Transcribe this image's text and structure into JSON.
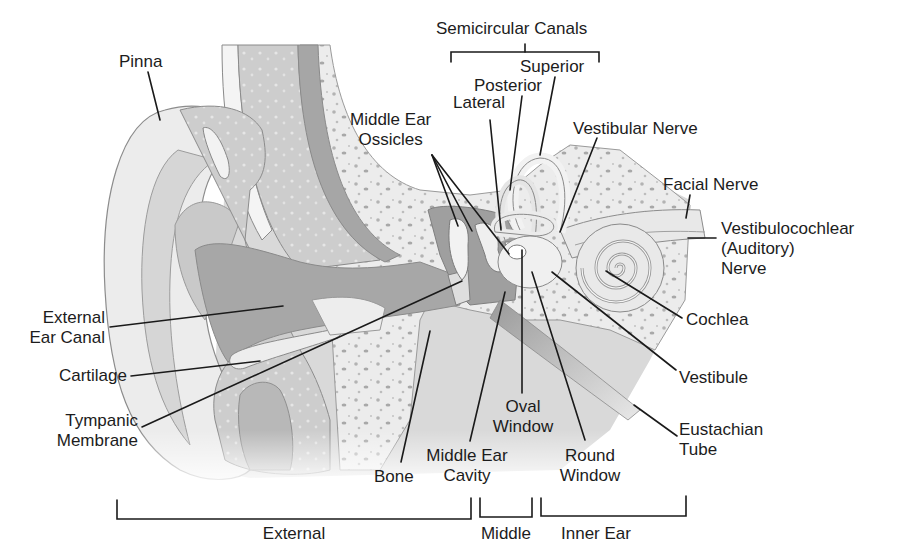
{
  "colors": {
    "background": "#ffffff",
    "skin_light": "#e6e6e6",
    "skin_mid": "#cfcfcf",
    "canal_dark": "#a9a9a9",
    "bone": "#ececec",
    "bone_spots": "#b5b5b5",
    "outline": "#8c8c8c",
    "leader_line": "#1a1a1a",
    "text": "#1c1c1c"
  },
  "labels": {
    "pinna": "Pinna",
    "semicircular_canals": "Semicircular Canals",
    "superior": "Superior",
    "posterior": "Posterior",
    "lateral": "Lateral",
    "middle_ear_ossicles": [
      "Middle Ear",
      "Ossicles"
    ],
    "vestibular_nerve": "Vestibular Nerve",
    "facial_nerve": "Facial Nerve",
    "vestibulocochlear_nerve": [
      "Vestibulocochlear",
      "(Auditory)",
      "Nerve"
    ],
    "external_ear_canal": [
      "External",
      "Ear Canal"
    ],
    "cochlea": "Cochlea",
    "cartilage": "Cartilage",
    "vestibule": "Vestibule",
    "tympanic_membrane": [
      "Tympanic",
      "Membrane"
    ],
    "oval_window": [
      "Oval",
      "Window"
    ],
    "eustachian_tube": [
      "Eustachian",
      "Tube"
    ],
    "bone": "Bone",
    "middle_ear_cavity": [
      "Middle Ear",
      "Cavity"
    ],
    "round_window": [
      "Round",
      "Window"
    ]
  },
  "regions": [
    {
      "label": "External",
      "x_start": 117,
      "x_end": 472
    },
    {
      "label": "Middle",
      "x_start": 480,
      "x_end": 532
    },
    {
      "label": "Inner Ear",
      "x_start": 541,
      "x_end": 686
    }
  ]
}
